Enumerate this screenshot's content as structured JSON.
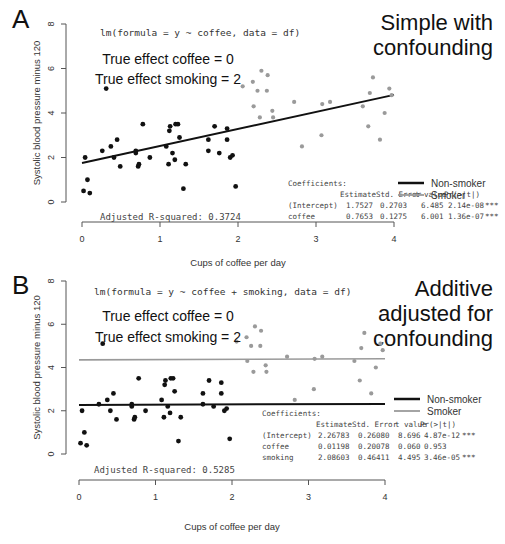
{
  "panels": [
    {
      "letter": "A",
      "title": "Simple with\nconfounding",
      "formula": "lm(formula = y ~ coffee, data = df)",
      "annotation_lines": [
        "True effect coffee = 0",
        "True effect smoking = 2"
      ],
      "adj_r2_label": "Adjusted R-squared:  0.3724",
      "coefficients_header": "Coefficients:",
      "coef_columns": [
        "",
        "Estimate",
        "Std. Error",
        "t value",
        "Pr(>|t|)",
        ""
      ],
      "coef_rows": [
        [
          "(Intercept)",
          "1.7527",
          "0.2703",
          "6.485",
          "2.14e-08",
          "***"
        ],
        [
          "coffee",
          "0.7653",
          "0.1275",
          "6.001",
          "1.36e-07",
          "***"
        ]
      ],
      "legend": [
        {
          "label": "Non-smoker",
          "color": "#111111"
        },
        {
          "label": "Smoker",
          "color": "#9a9a9a"
        }
      ],
      "xlabel": "Cups of coffee per day",
      "ylabel": "Systolic blood pressure minus 120"
    },
    {
      "letter": "B",
      "title": "Additive\nadjusted for\nconfounding",
      "formula": "lm(formula = y ~ coffee + smoking, data = df)",
      "annotation_lines": [
        "True effect coffee = 0",
        "True effect smoking = 2"
      ],
      "adj_r2_label": "Adjusted R-squared:  0.5285",
      "coefficients_header": "Coefficients:",
      "coef_columns": [
        "",
        "Estimate",
        "Std. Error",
        "t value",
        "Pr(>|t|)",
        ""
      ],
      "coef_rows": [
        [
          "(Intercept)",
          "2.26783",
          "0.26080",
          "8.696",
          "4.87e-12",
          "***"
        ],
        [
          "coffee",
          "0.01198",
          "0.20078",
          "0.060",
          "0.953",
          ""
        ],
        [
          "smoking",
          "2.08603",
          "0.46411",
          "4.495",
          "3.46e-05",
          "***"
        ]
      ],
      "legend": [
        {
          "label": "Non-smoker",
          "color": "#111111"
        },
        {
          "label": "Smoker",
          "color": "#9a9a9a"
        }
      ],
      "xlabel": "Cups of coffee per day",
      "ylabel": "Systolic blood pressure minus 120"
    }
  ],
  "chart_data": [
    {
      "type": "scatter",
      "title": "Simple with confounding",
      "panel": "A",
      "xlabel": "Cups of coffee per day",
      "ylabel": "Systolic blood pressure minus 120",
      "xlim": [
        0,
        4
      ],
      "ylim": [
        0,
        8
      ],
      "x_ticks": [
        0,
        1,
        2,
        3,
        4
      ],
      "y_ticks": [
        0,
        2,
        4,
        6,
        8
      ],
      "grid": false,
      "legend_position": "right",
      "series": [
        {
          "name": "Non-smoker",
          "color": "#111111",
          "points": [
            [
              0.02,
              0.5
            ],
            [
              0.04,
              2.0
            ],
            [
              0.07,
              1.0
            ],
            [
              0.1,
              0.4
            ],
            [
              0.26,
              2.3
            ],
            [
              0.31,
              5.1
            ],
            [
              0.37,
              2.5
            ],
            [
              0.41,
              2.0
            ],
            [
              0.45,
              2.8
            ],
            [
              0.49,
              1.6
            ],
            [
              0.69,
              2.3
            ],
            [
              0.69,
              2.2
            ],
            [
              0.72,
              1.6
            ],
            [
              0.73,
              1.7
            ],
            [
              0.78,
              3.5
            ],
            [
              0.87,
              2.0
            ],
            [
              1.08,
              2.5
            ],
            [
              1.11,
              1.7
            ],
            [
              1.12,
              3.2
            ],
            [
              1.13,
              3.4
            ],
            [
              1.16,
              2.2
            ],
            [
              1.19,
              1.9
            ],
            [
              1.2,
              3.5
            ],
            [
              1.23,
              3.5
            ],
            [
              1.25,
              2.9
            ],
            [
              1.3,
              0.6
            ],
            [
              1.33,
              1.7
            ],
            [
              1.62,
              2.8
            ],
            [
              1.62,
              2.3
            ],
            [
              1.7,
              3.4
            ],
            [
              1.76,
              2.2
            ],
            [
              1.86,
              3.3
            ],
            [
              1.86,
              2.8
            ],
            [
              1.9,
              2.0
            ],
            [
              1.93,
              2.1
            ],
            [
              1.97,
              0.7
            ]
          ]
        },
        {
          "name": "Smoker",
          "color": "#9a9a9a",
          "points": [
            [
              2.06,
              5.2
            ],
            [
              2.19,
              5.4
            ],
            [
              2.25,
              5.0
            ],
            [
              2.3,
              5.9
            ],
            [
              2.37,
              5.0
            ],
            [
              2.38,
              5.7
            ],
            [
              2.2,
              4.3
            ],
            [
              2.28,
              3.8
            ],
            [
              2.44,
              4.1
            ],
            [
              2.45,
              3.8
            ],
            [
              2.72,
              4.5
            ],
            [
              2.82,
              2.5
            ],
            [
              3.08,
              4.4
            ],
            [
              3.07,
              3.0
            ],
            [
              3.18,
              4.5
            ],
            [
              3.6,
              4.3
            ],
            [
              3.67,
              3.4
            ],
            [
              3.69,
              4.9
            ],
            [
              3.73,
              5.6
            ],
            [
              3.82,
              2.8
            ],
            [
              3.88,
              4.0
            ],
            [
              3.94,
              5.1
            ],
            [
              3.97,
              4.8
            ]
          ]
        }
      ],
      "fit_lines": [
        {
          "name": "fit",
          "color": "#111111",
          "intercept": 1.7527,
          "slope": 0.7653,
          "x_range": [
            0,
            4
          ]
        }
      ],
      "annotations": [
        "lm(formula = y ~ coffee, data = df)",
        "True effect coffee = 0",
        "True effect smoking = 2",
        "Adjusted R-squared: 0.3724"
      ]
    },
    {
      "type": "scatter",
      "title": "Additive adjusted for confounding",
      "panel": "B",
      "xlabel": "Cups of coffee per day",
      "ylabel": "Systolic blood pressure minus 120",
      "xlim": [
        0,
        4
      ],
      "ylim": [
        0,
        8
      ],
      "x_ticks": [
        0,
        1,
        2,
        3,
        4
      ],
      "y_ticks": [
        0,
        2,
        4,
        6,
        8
      ],
      "grid": false,
      "legend_position": "right",
      "series": [
        {
          "name": "Non-smoker",
          "color": "#111111",
          "points": [
            [
              0.02,
              0.5
            ],
            [
              0.04,
              2.0
            ],
            [
              0.07,
              1.0
            ],
            [
              0.1,
              0.4
            ],
            [
              0.26,
              2.3
            ],
            [
              0.31,
              5.1
            ],
            [
              0.37,
              2.5
            ],
            [
              0.41,
              2.0
            ],
            [
              0.45,
              2.8
            ],
            [
              0.49,
              1.6
            ],
            [
              0.69,
              2.3
            ],
            [
              0.69,
              2.2
            ],
            [
              0.72,
              1.6
            ],
            [
              0.73,
              1.7
            ],
            [
              0.78,
              3.5
            ],
            [
              0.87,
              2.0
            ],
            [
              1.08,
              2.5
            ],
            [
              1.11,
              1.7
            ],
            [
              1.12,
              3.2
            ],
            [
              1.13,
              3.4
            ],
            [
              1.16,
              2.2
            ],
            [
              1.19,
              1.9
            ],
            [
              1.2,
              3.5
            ],
            [
              1.23,
              3.5
            ],
            [
              1.25,
              2.9
            ],
            [
              1.3,
              0.6
            ],
            [
              1.33,
              1.7
            ],
            [
              1.62,
              2.8
            ],
            [
              1.62,
              2.3
            ],
            [
              1.7,
              3.4
            ],
            [
              1.76,
              2.2
            ],
            [
              1.86,
              3.3
            ],
            [
              1.86,
              2.8
            ],
            [
              1.9,
              2.0
            ],
            [
              1.93,
              2.1
            ],
            [
              1.97,
              0.7
            ]
          ]
        },
        {
          "name": "Smoker",
          "color": "#9a9a9a",
          "points": [
            [
              2.06,
              5.2
            ],
            [
              2.19,
              5.4
            ],
            [
              2.25,
              5.0
            ],
            [
              2.3,
              5.9
            ],
            [
              2.37,
              5.0
            ],
            [
              2.38,
              5.7
            ],
            [
              2.2,
              4.3
            ],
            [
              2.28,
              3.8
            ],
            [
              2.44,
              4.1
            ],
            [
              2.45,
              3.8
            ],
            [
              2.72,
              4.5
            ],
            [
              2.82,
              2.5
            ],
            [
              3.08,
              4.4
            ],
            [
              3.07,
              3.0
            ],
            [
              3.18,
              4.5
            ],
            [
              3.6,
              4.3
            ],
            [
              3.67,
              3.4
            ],
            [
              3.69,
              4.9
            ],
            [
              3.73,
              5.6
            ],
            [
              3.82,
              2.8
            ],
            [
              3.88,
              4.0
            ],
            [
              3.94,
              5.1
            ],
            [
              3.97,
              4.8
            ]
          ]
        }
      ],
      "fit_lines": [
        {
          "name": "Non-smoker",
          "color": "#111111",
          "intercept": 2.26783,
          "slope": 0.01198,
          "x_range": [
            0,
            4
          ]
        },
        {
          "name": "Smoker",
          "color": "#9a9a9a",
          "intercept": 4.35386,
          "slope": 0.01198,
          "x_range": [
            0,
            4
          ]
        }
      ],
      "annotations": [
        "lm(formula = y ~ coffee + smoking, data = df)",
        "True effect coffee = 0",
        "True effect smoking = 2",
        "Adjusted R-squared: 0.5285"
      ]
    }
  ]
}
